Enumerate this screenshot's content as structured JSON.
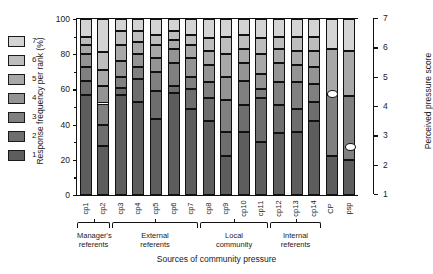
{
  "chart_data": {
    "type": "bar",
    "title": "",
    "subtitle": "",
    "xlabel": "Sources of community pressure",
    "ylabel": "Response frequency per rank (%)",
    "ylabel_secondary": "Perceived pressure score",
    "ylim": [
      0,
      100
    ],
    "yticks": [
      0,
      20,
      40,
      60,
      80,
      100
    ],
    "ylim_secondary": [
      1,
      7
    ],
    "yticks_secondary": [
      1,
      2,
      3,
      4,
      5,
      6,
      7
    ],
    "grid": false,
    "legend_position": "left-outside",
    "legend_title": "",
    "stacked": true,
    "categories": [
      "cp1",
      "cp2",
      "cp3",
      "cp4",
      "cp5",
      "cp6",
      "cp7",
      "cp8",
      "cp9",
      "cp10",
      "cp11",
      "cp12",
      "cp13",
      "cp14",
      "CP",
      "psp"
    ],
    "series": [
      {
        "name": "1",
        "color": "#5d5d5d",
        "values": [
          57,
          28,
          57,
          53,
          43,
          58,
          49,
          42,
          22,
          36,
          30,
          35,
          36,
          42,
          22,
          20
        ]
      },
      {
        "name": "2",
        "color": "#6e6e6e",
        "values": [
          8,
          12,
          4,
          13,
          16,
          4,
          11,
          13,
          14,
          15,
          25,
          16,
          13,
          11,
          0,
          0
        ]
      },
      {
        "name": "3",
        "color": "#808080",
        "values": [
          8,
          12,
          6,
          7,
          11,
          13,
          7,
          9,
          18,
          14,
          5,
          13,
          15,
          10,
          35,
          36
        ]
      },
      {
        "name": "4",
        "color": "#949494",
        "values": [
          7,
          10,
          9,
          7,
          8,
          8,
          11,
          10,
          13,
          10,
          9,
          11,
          10,
          10,
          0,
          0
        ]
      },
      {
        "name": "5",
        "color": "#a8a8a8",
        "values": [
          5,
          9,
          9,
          7,
          7,
          5,
          7,
          8,
          13,
          8,
          11,
          8,
          8,
          9,
          26,
          26
        ]
      },
      {
        "name": "6",
        "color": "#bdbdbd",
        "values": [
          5,
          10,
          8,
          6,
          6,
          5,
          6,
          7,
          10,
          8,
          9,
          7,
          8,
          8,
          0,
          0
        ]
      },
      {
        "name": "7",
        "color": "#d4d4d4",
        "values": [
          10,
          19,
          7,
          7,
          9,
          7,
          9,
          11,
          10,
          9,
          11,
          10,
          10,
          10,
          17,
          18
        ]
      }
    ],
    "markers": [
      {
        "category": "CP",
        "value": 4.4,
        "label": "CP mean",
        "shape": "diamond"
      },
      {
        "category": "psp",
        "value": 2.6,
        "label": "psp mean",
        "shape": "diamond"
      }
    ],
    "groups": [
      {
        "label_line1": "Manager's",
        "label_line2": "referents",
        "start": 0,
        "end": 1
      },
      {
        "label_line1": "External",
        "label_line2": "referents",
        "start": 2,
        "end": 6
      },
      {
        "label_line1": "Local",
        "label_line2": "community",
        "start": 7,
        "end": 10
      },
      {
        "label_line1": "Internal",
        "label_line2": "referents",
        "start": 11,
        "end": 13
      }
    ]
  },
  "legend": {
    "items": [
      {
        "label": "7",
        "color": "#d4d4d4"
      },
      {
        "label": "6",
        "color": "#bdbdbd"
      },
      {
        "label": "5",
        "color": "#a8a8a8"
      },
      {
        "label": "4",
        "color": "#949494"
      },
      {
        "label": "3",
        "color": "#808080"
      },
      {
        "label": "2",
        "color": "#6e6e6e"
      },
      {
        "label": "1",
        "color": "#5d5d5d"
      }
    ]
  },
  "axes": {
    "left_title": "Response frequency per rank (%)",
    "right_title": "Perceived pressure score",
    "bottom_title": "Sources of community pressure"
  }
}
